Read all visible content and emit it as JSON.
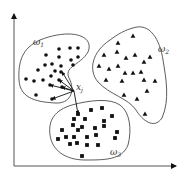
{
  "diagram": {
    "type": "cluster-scatter",
    "axes": {
      "origin": [
        14,
        166
      ],
      "x_end": 176,
      "y_end": 14,
      "color": "#555555"
    },
    "clusters": [
      {
        "id": "omega1",
        "label": "ω",
        "subscript": "1",
        "label_pos": [
          33,
          45
        ],
        "marker": "circle",
        "boundary": "M 40 40 C 70 28, 95 35, 88 52 C 80 66, 62 66, 70 80 C 75 92, 70 104, 55 103 C 40 102, 20 100, 19 80 C 18 62, 22 48, 40 40 Z",
        "points": [
          [
            46,
            55
          ],
          [
            59,
            49
          ],
          [
            70,
            48
          ],
          [
            78,
            48
          ],
          [
            59,
            57
          ],
          [
            71,
            60
          ],
          [
            78,
            57
          ],
          [
            45,
            65
          ],
          [
            52,
            64
          ],
          [
            61,
            66
          ],
          [
            73,
            65
          ],
          [
            38,
            70
          ],
          [
            55,
            71
          ],
          [
            61,
            72
          ],
          [
            51,
            76
          ],
          [
            43,
            80
          ],
          [
            34,
            81
          ],
          [
            26,
            79
          ],
          [
            50,
            85
          ],
          [
            59,
            80
          ],
          [
            36,
            95
          ],
          [
            52,
            99
          ],
          [
            62,
            87
          ]
        ]
      },
      {
        "id": "omega2",
        "label": "ω",
        "subscript": "2",
        "label_pos": [
          158,
          52
        ],
        "marker": "triangle",
        "boundary": "M 133 28 C 150 22, 160 40, 163 60 C 166 78, 170 100, 162 118 C 154 130, 142 120, 136 110 C 128 98, 110 95, 98 82 C 88 70, 92 52, 110 40 C 118 34, 125 30, 133 28 Z",
        "points": [
          [
            133,
            36
          ],
          [
            118,
            43
          ],
          [
            117,
            52
          ],
          [
            104,
            55
          ],
          [
            135,
            55
          ],
          [
            126,
            58
          ],
          [
            150,
            57
          ],
          [
            144,
            62
          ],
          [
            99,
            66
          ],
          [
            109,
            69
          ],
          [
            118,
            66
          ],
          [
            141,
            72
          ],
          [
            125,
            73
          ],
          [
            133,
            73
          ],
          [
            106,
            80
          ],
          [
            122,
            81
          ],
          [
            144,
            80
          ],
          [
            155,
            81
          ],
          [
            124,
            95
          ],
          [
            147,
            91
          ],
          [
            137,
            99
          ],
          [
            145,
            114
          ]
        ]
      },
      {
        "id": "omega3",
        "label": "ω",
        "subscript": "3",
        "label_pos": [
          110,
          155
        ],
        "marker": "square",
        "boundary": "M 72 105 C 90 100, 110 98, 120 105 C 130 112, 132 130, 128 145 C 122 160, 105 160, 85 160 C 65 160, 52 150, 50 135 C 48 120, 55 110, 72 105 Z",
        "points": [
          [
            78,
            114
          ],
          [
            91,
            110
          ],
          [
            102,
            108
          ],
          [
            74,
            119
          ],
          [
            85,
            119
          ],
          [
            104,
            121
          ],
          [
            112,
            116
          ],
          [
            73,
            125
          ],
          [
            82,
            127
          ],
          [
            95,
            128
          ],
          [
            104,
            126
          ],
          [
            117,
            132
          ],
          [
            62,
            130
          ],
          [
            78,
            130
          ],
          [
            66,
            137
          ],
          [
            74,
            137
          ],
          [
            87,
            137
          ],
          [
            96,
            135
          ],
          [
            115,
            138
          ],
          [
            58,
            139
          ],
          [
            70,
            144
          ],
          [
            77,
            143
          ],
          [
            87,
            145
          ],
          [
            98,
            145
          ],
          [
            82,
            156
          ]
        ]
      }
    ],
    "query_point": {
      "label": "x",
      "subscript": "j",
      "pos": [
        74,
        91
      ],
      "label_pos": [
        76,
        90
      ]
    },
    "neighbor_arrows": [
      [
        62,
        72
      ],
      [
        59,
        80
      ],
      [
        50,
        85
      ],
      [
        52,
        99
      ],
      [
        62,
        87
      ],
      [
        78,
        114
      ]
    ],
    "stroke_color": "#333333",
    "marker_color": "#111111"
  }
}
